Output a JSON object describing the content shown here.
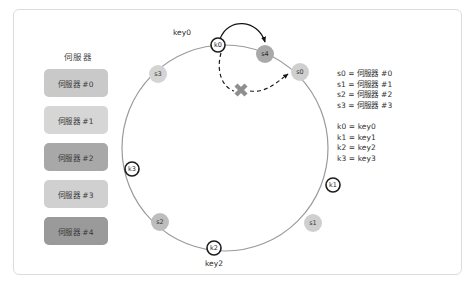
{
  "figure": {
    "frame_border_color": "#dcdcdc",
    "background": "#ffffff"
  },
  "server_panel": {
    "title": "伺服器",
    "items": [
      {
        "label": "伺服器 #0",
        "color": "#c9c9c9"
      },
      {
        "label": "伺服器 #1",
        "color": "#d6d6d6"
      },
      {
        "label": "伺服器 #2",
        "color": "#a8a8a8"
      },
      {
        "label": "伺服器 #3",
        "color": "#d0d0d0"
      },
      {
        "label": "伺服器 #4",
        "color": "#9a9a9a"
      }
    ]
  },
  "ring": {
    "stroke_color": "#9a9a9a",
    "server_nodes": [
      {
        "id": "s0",
        "label": "s0",
        "color": "#cfcfcf",
        "cx": 200,
        "cy": 63,
        "r": 9
      },
      {
        "id": "s1",
        "label": "s1",
        "color": "#cfcfcf",
        "cx": 213,
        "cy": 214,
        "r": 9
      },
      {
        "id": "s2",
        "label": "s2",
        "color": "#bdbdbd",
        "cx": 60,
        "cy": 213,
        "r": 9
      },
      {
        "id": "s3",
        "label": "s3",
        "color": "#d4d4d4",
        "cx": 58,
        "cy": 65,
        "r": 9
      },
      {
        "id": "s4",
        "label": "s4",
        "color": "#a9a9a9",
        "cx": 165,
        "cy": 45,
        "r": 9
      }
    ],
    "key_nodes": [
      {
        "id": "k0",
        "label": "k0",
        "cx": 118,
        "cy": 36,
        "r": 7
      },
      {
        "id": "k1",
        "label": "k1",
        "cx": 233,
        "cy": 176,
        "r": 7
      },
      {
        "id": "k2",
        "label": "k2",
        "cx": 114,
        "cy": 239,
        "r": 7
      },
      {
        "id": "k3",
        "label": "k3",
        "cx": 32,
        "cy": 160,
        "r": 7
      }
    ],
    "outside_labels": [
      {
        "text": "key0",
        "x": 82,
        "y": 26
      },
      {
        "text": "key2",
        "x": 101,
        "y": 256
      }
    ],
    "cross_mark": {
      "label": "failure-cross",
      "cx": 141,
      "cy": 81
    }
  },
  "legend": {
    "servers": [
      "s0 = 伺服器 #0",
      "s1 = 伺服器 #1",
      "s2 = 伺服器 #2",
      "s3 = 伺服器 #3"
    ],
    "keys": [
      "k0 = key0",
      "k1 = key1",
      "k2 = key2",
      "k3 = key3"
    ]
  }
}
